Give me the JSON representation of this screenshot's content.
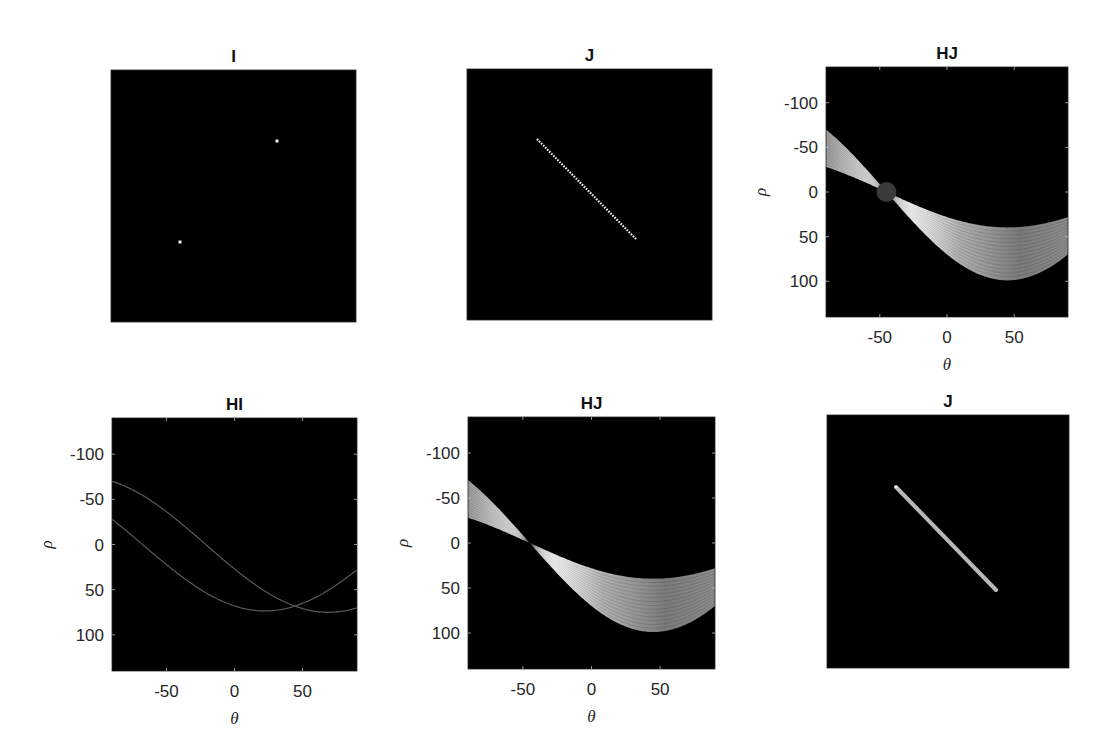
{
  "figure": {
    "background": "#ffffff",
    "panels": [
      {
        "id": "p1",
        "title": "I",
        "type": "image",
        "box": [
          111,
          70,
          356,
          322
        ],
        "axes": false,
        "points": [
          [
            277,
            141
          ],
          [
            180,
            242
          ]
        ]
      },
      {
        "id": "p2",
        "title": "J",
        "type": "image",
        "box": [
          467,
          69,
          712,
          320
        ],
        "axes": false,
        "line": [
          [
            537,
            139
          ],
          [
            637,
            240
          ]
        ],
        "style": "dotted"
      },
      {
        "id": "p3",
        "title": "HJ",
        "type": "hough",
        "box": [
          826,
          67,
          1068,
          317
        ],
        "axes": true,
        "band": {
          "tmin": 28,
          "tmax": 70
        },
        "marker": {
          "theta": -45,
          "rho": 0,
          "r": 10,
          "color": "#3a3a3a"
        }
      },
      {
        "id": "p4",
        "title": "HI",
        "type": "hough",
        "box": [
          112,
          418,
          357,
          671
        ],
        "axes": true,
        "curves": [
          {
            "a": 27,
            "b": 70
          },
          {
            "a": 68,
            "b": 28
          }
        ]
      },
      {
        "id": "p5",
        "title": "HJ",
        "type": "hough",
        "box": [
          468,
          417,
          715,
          669
        ],
        "axes": true,
        "band": {
          "tmin": 28,
          "tmax": 70
        }
      },
      {
        "id": "p6",
        "title": "J",
        "type": "image",
        "box": [
          827,
          415,
          1069,
          668
        ],
        "axes": false,
        "line": [
          [
            896,
            487
          ],
          [
            996,
            590
          ]
        ],
        "style": "solid"
      }
    ],
    "axes": {
      "xlabel": "θ",
      "ylabel": "ρ",
      "xlim": [
        -90,
        90
      ],
      "ylim": [
        -140,
        140
      ],
      "xticks": [
        -50,
        0,
        50
      ],
      "yticks": [
        -100,
        -50,
        0,
        50,
        100
      ],
      "xtick_labels": [
        "-50",
        "0",
        "50"
      ],
      "ytick_labels": [
        "-100",
        "-50",
        "0",
        "50",
        "100"
      ]
    },
    "colors": {
      "image_bg": "#000000",
      "curve": "#5a5a5a",
      "band_bright": "#f2f2f2",
      "band_dim": "#8a8a8a",
      "point": "#f0f0f0",
      "thick_line": "#b8b8b8"
    }
  },
  "chart_data": [
    {
      "type": "heatmap",
      "title": "I",
      "description": "binary image with two white points",
      "points_px": [
        [
          277,
          141
        ],
        [
          180,
          242
        ]
      ]
    },
    {
      "type": "heatmap",
      "title": "J",
      "description": "binary image with a dotted diagonal line segment (top-left to bottom-right)"
    },
    {
      "type": "heatmap",
      "title": "HJ",
      "xlabel": "θ",
      "ylabel": "ρ",
      "xlim": [
        -90,
        90
      ],
      "ylim": [
        -140,
        140
      ],
      "xticks": [
        -50,
        0,
        50
      ],
      "yticks": [
        -100,
        -50,
        0,
        50,
        100
      ],
      "description": "Hough transform of J: band of sinusoids converging at θ≈-45, ρ≈0 (circled peak); band upper edge ρ≈-70→38→28, lower edge ρ≈-28→95→70 across θ=-90,45,90"
    },
    {
      "type": "line",
      "title": "HI",
      "xlabel": "θ",
      "ylabel": "ρ",
      "xlim": [
        -90,
        90
      ],
      "ylim": [
        -140,
        140
      ],
      "xticks": [
        -50,
        0,
        50
      ],
      "yticks": [
        -100,
        -50,
        0,
        50,
        100
      ],
      "series": [
        {
          "name": "curve 1",
          "x": [
            -90,
            -45,
            0,
            45,
            69,
            90
          ],
          "values": [
            -70,
            -30,
            27,
            68,
            75,
            70
          ]
        },
        {
          "name": "curve 2",
          "x": [
            -90,
            -45,
            0,
            22,
            45,
            90
          ],
          "values": [
            -28,
            28,
            68,
            73,
            68,
            28
          ]
        }
      ],
      "annotations": [
        "curves intersect near θ≈44, ρ≈68"
      ]
    },
    {
      "type": "heatmap",
      "title": "HJ",
      "xlabel": "θ",
      "ylabel": "ρ",
      "xlim": [
        -90,
        90
      ],
      "ylim": [
        -140,
        140
      ],
      "xticks": [
        -50,
        0,
        50
      ],
      "yticks": [
        -100,
        -50,
        0,
        50,
        100
      ],
      "description": "Hough transform of J (no marker): band converging at θ≈-45, ρ≈0"
    },
    {
      "type": "heatmap",
      "title": "J",
      "description": "detected line drawn as solid gray diagonal segment"
    }
  ]
}
